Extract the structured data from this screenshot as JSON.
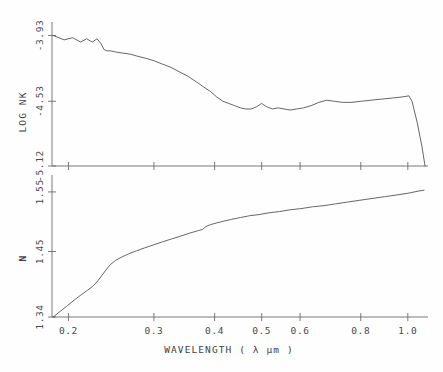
{
  "figure": {
    "background_color": "#fefefe",
    "line_color": "#555555",
    "axis_color": "#6b6b6b"
  },
  "xaxis": {
    "title": "WAVELENGTH ( λ μm )",
    "scale": "log",
    "tick_labels": [
      "0.2",
      "0.3",
      "0.4",
      "0.5",
      "0.6",
      "0.8",
      "1.0"
    ],
    "tick_values": [
      0.2,
      0.3,
      0.4,
      0.5,
      0.6,
      0.8,
      1.0
    ],
    "range": [
      0.185,
      1.09
    ]
  },
  "upper_panel": {
    "ylabel": "LOG NK",
    "tick_labels": [
      "-3.93",
      "-4.53",
      "-5.12"
    ],
    "tick_values": [
      -3.93,
      -4.53,
      -5.12
    ]
  },
  "lower_panel": {
    "ylabel": "N",
    "tick_labels": [
      "1.55",
      "1.45",
      "1.34"
    ],
    "tick_values": [
      1.55,
      1.45,
      1.34
    ]
  },
  "chart_data": [
    {
      "type": "line",
      "title": "",
      "panel": "upper",
      "xlabel": "WAVELENGTH ( λ μm )",
      "ylabel": "LOG NK",
      "xscale": "log",
      "xlim": [
        0.185,
        1.09
      ],
      "ylim": [
        -5.12,
        -3.88
      ],
      "xticks": [
        0.2,
        0.3,
        0.4,
        0.5,
        0.6,
        0.8,
        1.0
      ],
      "yticks": [
        -3.93,
        -4.53,
        -5.12
      ],
      "grid": false,
      "legend": "none",
      "series": [
        {
          "name": "LOG NK",
          "x": [
            0.186,
            0.196,
            0.204,
            0.212,
            0.218,
            0.224,
            0.229,
            0.233,
            0.237,
            0.24,
            0.244,
            0.25,
            0.258,
            0.268,
            0.278,
            0.29,
            0.3,
            0.312,
            0.325,
            0.338,
            0.352,
            0.366,
            0.38,
            0.392,
            0.404,
            0.416,
            0.428,
            0.44,
            0.452,
            0.464,
            0.476,
            0.488,
            0.5,
            0.512,
            0.526,
            0.54,
            0.556,
            0.572,
            0.59,
            0.61,
            0.632,
            0.656,
            0.68,
            0.706,
            0.734,
            0.764,
            0.8,
            0.84,
            0.884,
            0.93,
            0.975,
            1.005,
            1.02,
            1.045,
            1.07,
            1.085
          ],
          "y": [
            -3.93,
            -3.97,
            -3.95,
            -3.99,
            -3.96,
            -3.99,
            -3.96,
            -4.0,
            -4.06,
            -4.07,
            -4.07,
            -4.08,
            -4.09,
            -4.1,
            -4.12,
            -4.14,
            -4.16,
            -4.19,
            -4.22,
            -4.26,
            -4.3,
            -4.35,
            -4.4,
            -4.44,
            -4.49,
            -4.53,
            -4.55,
            -4.57,
            -4.59,
            -4.6,
            -4.6,
            -4.58,
            -4.55,
            -4.58,
            -4.6,
            -4.59,
            -4.6,
            -4.61,
            -4.6,
            -4.59,
            -4.57,
            -4.54,
            -4.52,
            -4.53,
            -4.54,
            -4.54,
            -4.53,
            -4.52,
            -4.51,
            -4.5,
            -4.49,
            -4.48,
            -4.53,
            -4.72,
            -4.95,
            -5.12
          ]
        }
      ]
    },
    {
      "type": "line",
      "title": "",
      "panel": "lower",
      "xlabel": "WAVELENGTH ( λ μm )",
      "ylabel": "N",
      "xscale": "log",
      "xlim": [
        0.185,
        1.09
      ],
      "ylim": [
        1.34,
        1.565
      ],
      "xticks": [
        0.2,
        0.3,
        0.4,
        0.5,
        0.6,
        0.8,
        1.0
      ],
      "yticks": [
        1.34,
        1.45,
        1.55
      ],
      "grid": false,
      "legend": "none",
      "series": [
        {
          "name": "N",
          "x": [
            0.186,
            0.192,
            0.199,
            0.206,
            0.213,
            0.219,
            0.224,
            0.229,
            0.234,
            0.239,
            0.244,
            0.25,
            0.258,
            0.266,
            0.276,
            0.287,
            0.299,
            0.312,
            0.326,
            0.341,
            0.356,
            0.37,
            0.378,
            0.384,
            0.392,
            0.404,
            0.418,
            0.434,
            0.452,
            0.472,
            0.494,
            0.518,
            0.544,
            0.572,
            0.602,
            0.636,
            0.672,
            0.71,
            0.752,
            0.796,
            0.844,
            0.896,
            0.95,
            1.005,
            1.045,
            1.08
          ],
          "y": [
            1.34,
            1.349,
            1.359,
            1.369,
            1.378,
            1.385,
            1.391,
            1.399,
            1.409,
            1.419,
            1.428,
            1.435,
            1.441,
            1.446,
            1.451,
            1.456,
            1.461,
            1.466,
            1.471,
            1.476,
            1.481,
            1.485,
            1.487,
            1.492,
            1.495,
            1.498,
            1.501,
            1.504,
            1.507,
            1.51,
            1.512,
            1.515,
            1.517,
            1.52,
            1.522,
            1.525,
            1.527,
            1.53,
            1.533,
            1.536,
            1.539,
            1.542,
            1.545,
            1.548,
            1.551,
            1.553
          ]
        }
      ]
    }
  ]
}
